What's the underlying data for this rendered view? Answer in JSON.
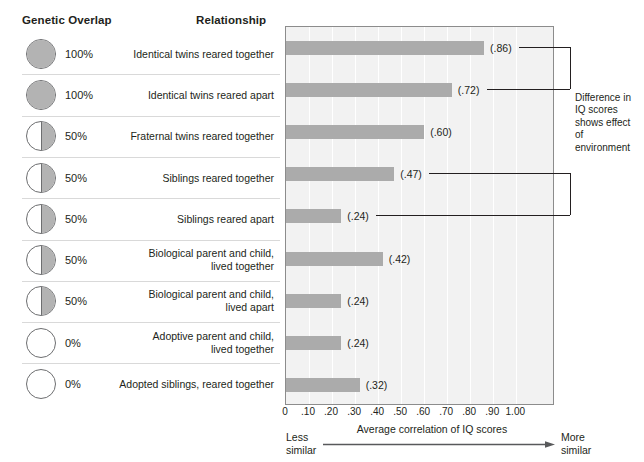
{
  "headers": {
    "genetic_overlap": "Genetic Overlap",
    "relationship": "Relationship"
  },
  "annotation": {
    "note": "Difference in IQ scores shows effect of environment"
  },
  "axis": {
    "caption": "Average correlation of IQ scores",
    "less_similar": "Less\nsimilar",
    "more_similar": "More\nsimilar",
    "ticks": [
      "0",
      ".10",
      ".20",
      ".30",
      ".40",
      ".50",
      ".60",
      ".70",
      ".80",
      ".90",
      "1.00"
    ]
  },
  "colors": {
    "bar": "#ababab",
    "plot_bg": "#f2f2f2",
    "circle_fill": "#b3b3b3",
    "circle_stroke": "#6d6e70",
    "text": "#231f20"
  },
  "chart_data": {
    "type": "bar",
    "title": "",
    "xlabel": "Average correlation of IQ scores",
    "ylabel": "Relationship",
    "xlim": [
      0,
      1.0
    ],
    "grid": true,
    "orientation": "horizontal",
    "categories": [
      "Identical twins reared together",
      "Identical twins reared apart",
      "Fraternal twins reared together",
      "Siblings reared together",
      "Siblings reared apart",
      "Biological parent and child,\nlived together",
      "Biological parent and child,\nlived apart",
      "Adoptive parent and child,\nlived together",
      "Adopted siblings, reared together"
    ],
    "values": [
      0.86,
      0.72,
      0.6,
      0.47,
      0.24,
      0.42,
      0.24,
      0.24,
      0.32
    ],
    "value_labels": [
      "(.86)",
      "(.72)",
      "(.60)",
      "(.47)",
      "(.24)",
      "(.42)",
      "(.24)",
      "(.24)",
      "(.32)"
    ],
    "genetic_overlap": [
      "100%",
      "100%",
      "50%",
      "50%",
      "50%",
      "50%",
      "50%",
      "0%",
      "0%"
    ],
    "genetic_overlap_fraction": [
      1.0,
      1.0,
      0.5,
      0.5,
      0.5,
      0.5,
      0.5,
      0.0,
      0.0
    ],
    "bracket_pairs": [
      {
        "from": "Identical twins reared together",
        "to": "Identical twins reared apart"
      },
      {
        "from": "Siblings reared together",
        "to": "Siblings reared apart"
      }
    ]
  }
}
